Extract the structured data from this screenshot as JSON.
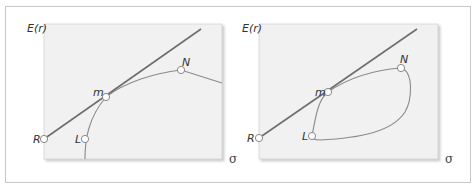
{
  "figure": {
    "panels": [
      {
        "id": "left",
        "y_axis_label": "E(r)",
        "x_axis_label": "σ",
        "points": {
          "R": "R",
          "L": "L",
          "m": "m",
          "N": "N"
        },
        "description": "Efficient frontier (curve from L through m to N) with capital market line from R tangent at m"
      },
      {
        "id": "right",
        "y_axis_label": "E(r)",
        "x_axis_label": "σ",
        "points": {
          "R": "R",
          "L": "L",
          "m": "m",
          "N": "N"
        },
        "description": "Closed feasible set (loop L–m–N) with capital market line from R tangent at m"
      }
    ],
    "colors": {
      "plot_background": "#f1f1f1",
      "line": "#6e6e6e",
      "curve": "#8a8a8a",
      "marker_fill": "#ffffff",
      "frame_border": "#c8c8c8"
    }
  }
}
